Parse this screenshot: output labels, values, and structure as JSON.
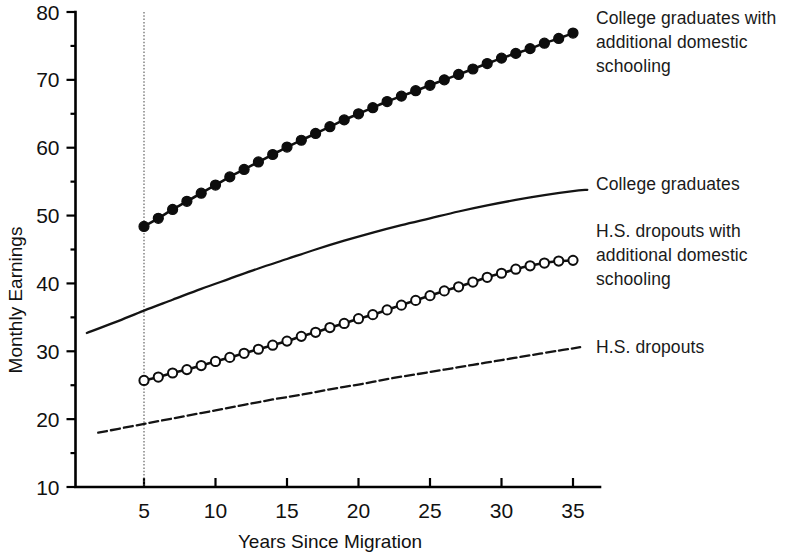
{
  "chart_data": {
    "type": "line",
    "title": "",
    "xlabel": "Years Since Migration",
    "ylabel": "Monthly Earnings",
    "xlim": [
      1,
      36
    ],
    "ylim": [
      10,
      80
    ],
    "xticks": [
      5,
      10,
      15,
      20,
      25,
      30,
      35
    ],
    "yticks": [
      10,
      20,
      30,
      40,
      50,
      60,
      70,
      80
    ],
    "yminor": [
      15,
      25,
      35,
      45,
      55,
      65,
      75
    ],
    "grid": false,
    "legend_position": "right-inline-annotations",
    "annotations": [
      {
        "text": "vertical reference line at x = 5",
        "x": 5
      }
    ],
    "series": [
      {
        "name": "College graduates with additional domestic schooling",
        "marker": "filled-circle",
        "linestyle": "solid",
        "x": [
          5,
          6,
          7,
          8,
          9,
          10,
          11,
          12,
          13,
          14,
          15,
          16,
          17,
          18,
          19,
          20,
          21,
          22,
          23,
          24,
          25,
          26,
          27,
          28,
          29,
          30,
          31,
          32,
          33,
          34,
          35
        ],
        "values": [
          48.4,
          49.6,
          50.9,
          52.1,
          53.3,
          54.5,
          55.7,
          56.8,
          57.9,
          59.0,
          60.1,
          61.1,
          62.1,
          63.1,
          64.1,
          65.0,
          65.9,
          66.8,
          67.6,
          68.4,
          69.2,
          70.0,
          70.8,
          71.6,
          72.4,
          73.2,
          73.9,
          74.6,
          75.4,
          76.1,
          76.9
        ]
      },
      {
        "name": "College graduates",
        "marker": "none",
        "linestyle": "solid",
        "x": [
          1,
          3,
          5,
          7,
          9,
          11,
          13,
          15,
          17,
          19,
          21,
          23,
          25,
          27,
          29,
          31,
          33,
          35,
          36
        ],
        "values": [
          32.7,
          34.3,
          36.0,
          37.6,
          39.2,
          40.7,
          42.2,
          43.6,
          45.0,
          46.3,
          47.5,
          48.6,
          49.6,
          50.6,
          51.5,
          52.3,
          53.0,
          53.6,
          53.8
        ]
      },
      {
        "name": "H.S. dropouts with additional domestic schooling",
        "marker": "open-circle",
        "linestyle": "solid",
        "x": [
          5,
          6,
          7,
          8,
          9,
          10,
          11,
          12,
          13,
          14,
          15,
          16,
          17,
          18,
          19,
          20,
          21,
          22,
          23,
          24,
          25,
          26,
          27,
          28,
          29,
          30,
          31,
          32,
          33,
          34,
          35
        ],
        "values": [
          25.7,
          26.2,
          26.8,
          27.3,
          27.9,
          28.5,
          29.1,
          29.7,
          30.3,
          30.9,
          31.5,
          32.2,
          32.8,
          33.5,
          34.1,
          34.8,
          35.4,
          36.1,
          36.8,
          37.5,
          38.2,
          38.9,
          39.5,
          40.2,
          40.9,
          41.5,
          42.1,
          42.6,
          43.0,
          43.3,
          43.4
        ]
      },
      {
        "name": "H.S. dropouts",
        "marker": "none",
        "linestyle": "dashed",
        "x": [
          1.8,
          4,
          6,
          8,
          10,
          12,
          14,
          16,
          18,
          20,
          22,
          24,
          26,
          28,
          30,
          32,
          34,
          35.5
        ],
        "values": [
          18.0,
          18.9,
          19.7,
          20.5,
          21.3,
          22.1,
          22.9,
          23.6,
          24.4,
          25.1,
          25.9,
          26.6,
          27.3,
          28.0,
          28.7,
          29.4,
          30.1,
          30.6
        ]
      }
    ]
  },
  "labels": {
    "ylabel": "Monthly Earnings",
    "xlabel": "Years Since Migration",
    "series_college_extra": "College graduates with\nadditional domestic\nschooling",
    "series_college": "College graduates",
    "series_hs_extra": "H.S. dropouts with\nadditional domestic\nschooling",
    "series_hs": "H.S. dropouts"
  }
}
